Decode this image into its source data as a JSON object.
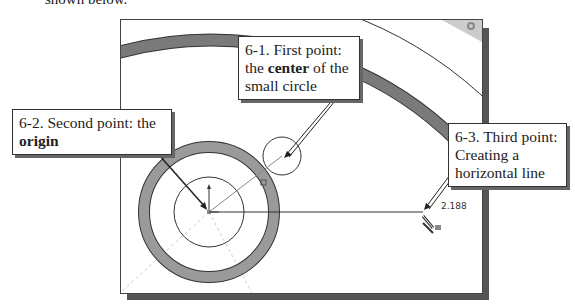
{
  "page": {
    "top_text": "shown below."
  },
  "callouts": {
    "first": {
      "line1": "6-1. First point:",
      "line2_pre": "the ",
      "line2_bold": "center",
      "line2_post": " of the",
      "line3": "small circle"
    },
    "second": {
      "line1": "6-2. Second point: the",
      "line2_bold": "origin"
    },
    "third": {
      "line1": "6-3. Third point:",
      "line2": "Creating a",
      "line3": "horizontal line"
    }
  },
  "sketch": {
    "dimension_value": "2.188",
    "icons": [
      "horizontal-constraint-icon",
      "origin-icon",
      "corner-view-icon"
    ],
    "colors": {
      "ring_dark": "#7a7a7a",
      "ring_light": "#b0b0b0",
      "line": "#333333",
      "shadow": "#555555"
    }
  }
}
